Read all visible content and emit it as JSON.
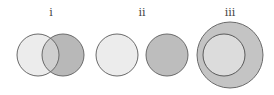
{
  "diagrams": [
    {
      "label": "i",
      "label_pos": [
        51,
        14
      ],
      "relation": "overlapping",
      "circles": [
        {
          "cx": 38,
          "cy": 55,
          "r": 21,
          "fill": "#ececec"
        },
        {
          "cx": 63,
          "cy": 55,
          "r": 21,
          "fill": "#b8b8b8"
        }
      ],
      "overlap_fill": "#cfcfcf"
    },
    {
      "label": "ii",
      "label_pos": [
        142,
        14
      ],
      "relation": "disjoint",
      "circles": [
        {
          "cx": 117,
          "cy": 55,
          "r": 21,
          "fill": "#ececec"
        },
        {
          "cx": 167,
          "cy": 55,
          "r": 21,
          "fill": "#bdbdbd"
        }
      ]
    },
    {
      "label": "iii",
      "label_pos": [
        230,
        14
      ],
      "relation": "contained",
      "circles": [
        {
          "cx": 230,
          "cy": 55,
          "r": 33,
          "fill": "#c4c4c4"
        },
        {
          "cx": 224,
          "cy": 55,
          "r": 21,
          "fill": "#dcdcdc"
        }
      ]
    }
  ],
  "stroke_color": "#6a6a6a"
}
